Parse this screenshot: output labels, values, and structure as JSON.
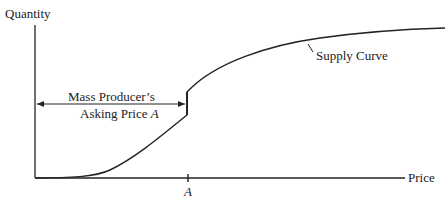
{
  "diagram": {
    "y_axis_label": "Quantity",
    "x_axis_label": "Price",
    "curve_label": "Supply Curve",
    "annotation_line1": "Mass Producer’s",
    "annotation_line2_prefix": "Asking Price ",
    "annotation_line2_var": "A",
    "tick_label": "A",
    "stroke_color": "#222222",
    "background_color": "#ffffff"
  }
}
